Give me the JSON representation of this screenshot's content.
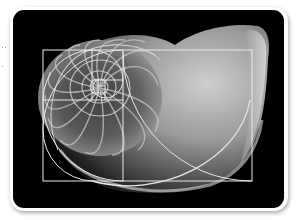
{
  "image": {
    "subject": "Nautilus shell with golden ratio spiral overlay",
    "background_color": "#000000",
    "frame_color": "#ffffff",
    "overlay_line_color": "#e8e8e8",
    "shell_colors": {
      "highlight": "#d6d6d6",
      "mid": "#8a8a8a",
      "shadow": "#2a2a2a"
    }
  }
}
